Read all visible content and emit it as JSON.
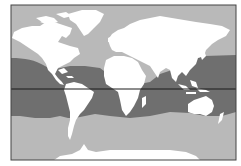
{
  "map": {
    "description": "World map showing distribution range in tropical and subtropical oceans",
    "projection": "Miller cylindrical",
    "colors": {
      "background": "#ffffff",
      "frame": "#444444",
      "ocean": "#b9b9b9",
      "land": "#ffffff",
      "range": "#6f6f6f",
      "equator": "#1a1a1a"
    },
    "layers": [
      {
        "name": "ocean",
        "kind": "fill"
      },
      {
        "name": "distribution-range",
        "kind": "shaded-band",
        "extent": "tropical and subtropical oceans, approx. 35°N to 35°S"
      },
      {
        "name": "landmasses",
        "kind": "fill"
      },
      {
        "name": "equator",
        "kind": "line",
        "latitude": 0
      }
    ],
    "regions_labeled": []
  }
}
